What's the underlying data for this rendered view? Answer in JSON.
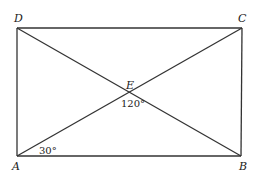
{
  "diagram": {
    "type": "geometry",
    "shape": "rectangle with diagonals",
    "points": {
      "A": {
        "label": "A",
        "x": 17,
        "y": 156
      },
      "B": {
        "label": "B",
        "x": 241,
        "y": 156
      },
      "C": {
        "label": "C",
        "x": 242,
        "y": 28
      },
      "D": {
        "label": "D",
        "x": 17,
        "y": 28
      },
      "E": {
        "label": "E",
        "x": 129,
        "y": 92
      }
    },
    "segments": [
      "AB",
      "BC",
      "CD",
      "DA",
      "AC",
      "BD"
    ],
    "angles": [
      {
        "at": "A",
        "label": "30°"
      },
      {
        "at": "E",
        "label": "120°"
      }
    ],
    "stroke_color": "#333333"
  }
}
